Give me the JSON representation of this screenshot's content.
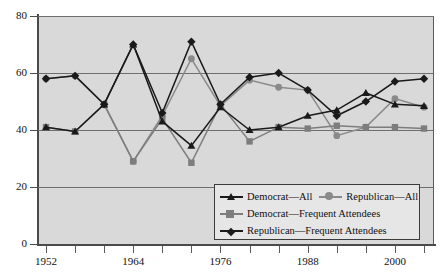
{
  "chart_data": {
    "type": "line",
    "title": "",
    "xlabel": "",
    "ylabel": "",
    "xlim": [
      1952,
      2004
    ],
    "ylim": [
      0,
      80
    ],
    "yticks": [
      0,
      20,
      40,
      60,
      80
    ],
    "ytick_labels": [
      "0",
      "20",
      "40",
      "60",
      "80"
    ],
    "x": [
      1952,
      1956,
      1960,
      1964,
      1968,
      1972,
      1976,
      1980,
      1984,
      1988,
      1992,
      1996,
      2000,
      2004
    ],
    "xticks": [
      1952,
      1956,
      1960,
      1964,
      1968,
      1972,
      1976,
      1980,
      1984,
      1988,
      1992,
      1996,
      2000,
      2004
    ],
    "xtick_labels": [
      "1952",
      "",
      "",
      "1964",
      "",
      "",
      "1976",
      "",
      "",
      "1988",
      "",
      "",
      "2000",
      ""
    ],
    "xtick_labels_shown": [
      "1952",
      "1964",
      "1976",
      "1988",
      "2000"
    ],
    "grid": true,
    "grid_axis": "y",
    "legend_position": "bottom-right",
    "background": "#d9d9d9",
    "series": [
      {
        "name": "Democrat—All",
        "marker": "triangle",
        "color": "#1a1a1a",
        "values": [
          41,
          39.5,
          49,
          70,
          43,
          34.5,
          48,
          40,
          41,
          45,
          47,
          53,
          49,
          48.5
        ]
      },
      {
        "name": "Republican—All",
        "marker": "circle",
        "color": "#8a8a8a",
        "values": [
          58,
          59,
          49,
          29,
          45,
          65,
          48.5,
          57.5,
          55,
          54,
          38,
          41,
          51,
          48
        ]
      },
      {
        "name": "Democrat—Frequent Attendees",
        "marker": "square",
        "color": "#7d7d7d",
        "values": [
          41,
          39.5,
          49,
          29,
          44,
          28.5,
          49,
          36,
          41,
          40.5,
          41.5,
          41,
          41,
          40.5
        ]
      },
      {
        "name": "Republican—Frequent Attendees",
        "marker": "diamond",
        "color": "#1a1a1a",
        "values": [
          58,
          59,
          49,
          70,
          46,
          71,
          49,
          58.5,
          60,
          54,
          45,
          50,
          57,
          58
        ]
      }
    ]
  },
  "legend": {
    "rows": [
      [
        {
          "label": "Democrat—All",
          "marker": "triangle",
          "color": "#1a1a1a"
        },
        {
          "label": "Republican—All",
          "marker": "circle",
          "color": "#8a8a8a"
        }
      ],
      [
        {
          "label": "Democrat—Frequent Attendees",
          "marker": "square",
          "color": "#7d7d7d"
        }
      ],
      [
        {
          "label": "Republican—Frequent Attendees",
          "marker": "diamond",
          "color": "#1a1a1a"
        }
      ]
    ]
  },
  "axis": {
    "y_labels": [
      "80",
      "60",
      "40",
      "20",
      "0"
    ],
    "x_labels": [
      "1952",
      "1964",
      "1976",
      "1988",
      "2000"
    ]
  },
  "colors": {
    "plot_background": "#d9d9d9",
    "frame": "#4a4a4a",
    "gridline": "#6e6e6e",
    "dark_series": "#1a1a1a",
    "light_series": "#8a8a8a",
    "mid_series": "#7d7d7d",
    "legend_background": "#e6e6e6"
  }
}
